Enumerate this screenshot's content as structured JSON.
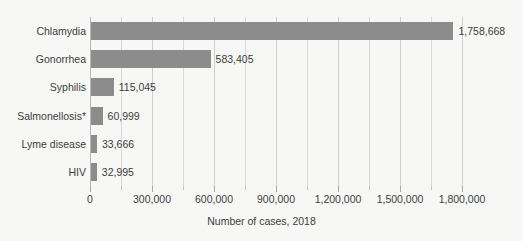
{
  "chart_data": {
    "type": "bar",
    "orientation": "horizontal",
    "title": "",
    "xlabel": "Number of cases, 2018",
    "ylabel": "",
    "categories": [
      "Chlamydia",
      "Gonorrhea",
      "Syphilis",
      "Salmonellosis*",
      "Lyme disease",
      "HIV"
    ],
    "values": [
      1758668,
      583405,
      115045,
      60999,
      33666,
      32995
    ],
    "value_labels": [
      "1,758,668",
      "583,405",
      "115,045",
      "60,999",
      "33,666",
      "32,995"
    ],
    "xlim": [
      0,
      1800000
    ],
    "xticks": [
      0,
      300000,
      600000,
      900000,
      1200000,
      1500000,
      1800000
    ],
    "xtick_labels": [
      "0",
      "300,000",
      "600,000",
      "900,000",
      "1,200,000",
      "1,500,000",
      "1,800,000"
    ],
    "minor_tick_step": 150000,
    "grid": "vertical-only",
    "legend": "none",
    "bar_color": "#8c8c8c",
    "background_color": "#f7f7f5",
    "text_color": "#3d3d3d",
    "gridline_color": "#d8d8d6"
  }
}
